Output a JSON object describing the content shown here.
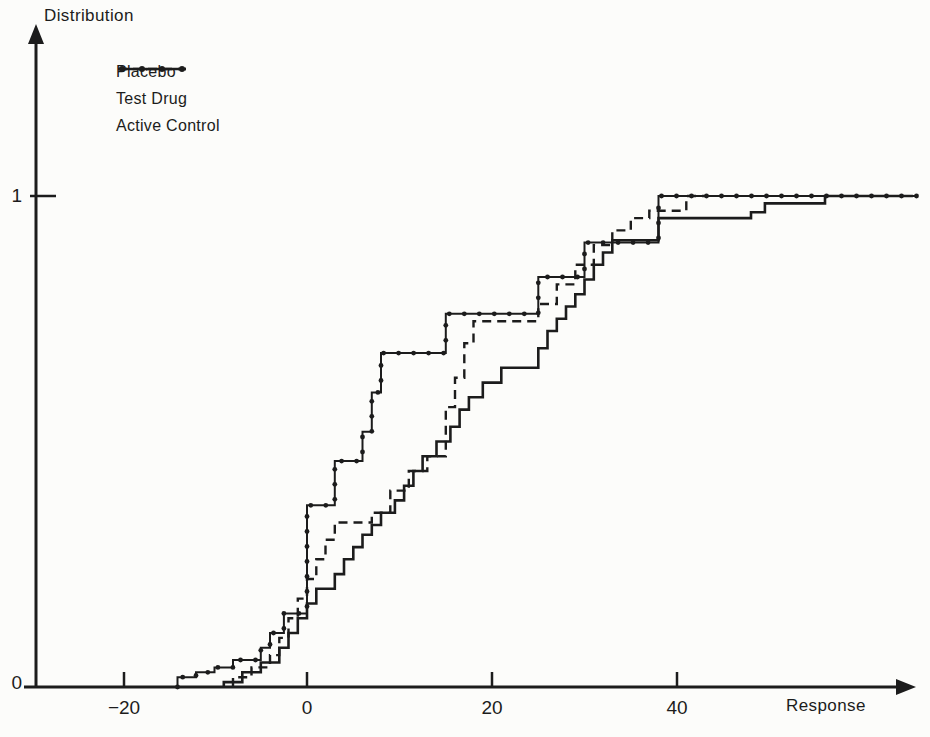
{
  "page": {
    "background": "#fcfcfa",
    "ink": "#1c1c1c"
  },
  "chart_data": {
    "type": "line",
    "subtype": "empirical-cdf-step-functions",
    "title": "",
    "xlabel": "Response",
    "ylabel": "Distribution",
    "xlim": [
      -30,
      67
    ],
    "ylim": [
      0,
      1.1
    ],
    "grid": false,
    "x_ticks": [
      -20,
      0,
      20,
      40
    ],
    "x_tick_labels": [
      "−20",
      "0",
      "20",
      "40"
    ],
    "y_ticks": [
      0,
      1
    ],
    "y_tick_labels": [
      "0",
      "1"
    ],
    "legend_position": "top-left-inside",
    "series": [
      {
        "name": "Placebo",
        "line_style": "solid-with-dot-markers",
        "color": "#1c1c1c",
        "points": [
          [
            -14,
            0.02
          ],
          [
            -12,
            0.03
          ],
          [
            -10,
            0.04
          ],
          [
            -8,
            0.055
          ],
          [
            -5,
            0.08
          ],
          [
            -4,
            0.11
          ],
          [
            -2.5,
            0.15
          ],
          [
            0,
            0.37
          ],
          [
            3,
            0.46
          ],
          [
            6,
            0.52
          ],
          [
            7,
            0.6
          ],
          [
            8,
            0.68
          ],
          [
            15,
            0.76
          ],
          [
            25,
            0.835
          ],
          [
            30,
            0.905
          ],
          [
            38,
            1.0
          ]
        ],
        "end_x": 66
      },
      {
        "name": "Test Drug",
        "line_style": "dashed",
        "color": "#1c1c1c",
        "points": [
          [
            -8,
            0.02
          ],
          [
            -6,
            0.04
          ],
          [
            -4,
            0.065
          ],
          [
            -3,
            0.1
          ],
          [
            -2,
            0.14
          ],
          [
            -1,
            0.18
          ],
          [
            0,
            0.22
          ],
          [
            1,
            0.26
          ],
          [
            2,
            0.3
          ],
          [
            3,
            0.335
          ],
          [
            7,
            0.355
          ],
          [
            9,
            0.4
          ],
          [
            11,
            0.44
          ],
          [
            13,
            0.47
          ],
          [
            15,
            0.57
          ],
          [
            16,
            0.63
          ],
          [
            17,
            0.7
          ],
          [
            18,
            0.745
          ],
          [
            25,
            0.78
          ],
          [
            27,
            0.82
          ],
          [
            29,
            0.86
          ],
          [
            31,
            0.9
          ],
          [
            33,
            0.93
          ],
          [
            35,
            0.955
          ],
          [
            37,
            0.97
          ],
          [
            41,
            1.0
          ]
        ],
        "end_x": 43
      },
      {
        "name": "Active Control",
        "line_style": "solid",
        "color": "#1c1c1c",
        "points": [
          [
            -9,
            0.01
          ],
          [
            -7,
            0.03
          ],
          [
            -5,
            0.05
          ],
          [
            -3,
            0.08
          ],
          [
            -2,
            0.11
          ],
          [
            -1,
            0.14
          ],
          [
            0,
            0.17
          ],
          [
            1,
            0.2
          ],
          [
            3,
            0.23
          ],
          [
            4,
            0.26
          ],
          [
            5,
            0.285
          ],
          [
            6,
            0.31
          ],
          [
            7,
            0.33
          ],
          [
            8,
            0.355
          ],
          [
            9.5,
            0.38
          ],
          [
            10.5,
            0.41
          ],
          [
            11.5,
            0.44
          ],
          [
            12.5,
            0.47
          ],
          [
            14,
            0.5
          ],
          [
            15.5,
            0.53
          ],
          [
            16.5,
            0.565
          ],
          [
            17.5,
            0.59
          ],
          [
            19,
            0.62
          ],
          [
            21,
            0.65
          ],
          [
            25,
            0.69
          ],
          [
            26,
            0.725
          ],
          [
            27,
            0.75
          ],
          [
            28,
            0.775
          ],
          [
            29,
            0.8
          ],
          [
            30,
            0.83
          ],
          [
            31,
            0.86
          ],
          [
            32,
            0.885
          ],
          [
            33,
            0.91
          ],
          [
            38,
            0.955
          ],
          [
            48,
            0.967
          ],
          [
            49.5,
            0.985
          ],
          [
            56,
            1.0
          ]
        ],
        "end_x": 65.5
      }
    ],
    "axes_map": {
      "x_origin_px": 307,
      "px_per_unit_x": 9.25,
      "y_zero_px": 687,
      "px_per_unit_full_scale_y": 491
    }
  }
}
